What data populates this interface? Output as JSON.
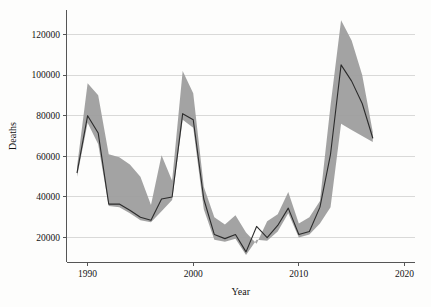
{
  "chart_data": {
    "type": "line",
    "title": "",
    "subtitle": "",
    "xlabel": "Year",
    "ylabel": "Deaths",
    "xlim": [
      1988.0,
      2021.0
    ],
    "ylim": [
      8000,
      132000
    ],
    "grid": true,
    "grid_axis": "y",
    "legend": "none",
    "band_label": "uncertainty interval",
    "band_color": "#9e9e9e",
    "line_color": "#2b2b2b",
    "grid_color": "#c9c9c9",
    "axis_color": "#555555",
    "background_color": "#fdfdfc",
    "x": [
      1989,
      1990,
      1991,
      1992,
      1993,
      1994,
      1995,
      1996,
      1997,
      1998,
      1999,
      2000,
      2001,
      2002,
      2003,
      2004,
      2005,
      2006,
      2007,
      2008,
      2009,
      2010,
      2011,
      2012,
      2013,
      2014,
      2015,
      2016,
      2017
    ],
    "xticks": [
      1990,
      2000,
      2010,
      2020
    ],
    "xticklabels": [
      "1990",
      "2000",
      "2010",
      "2020"
    ],
    "yticks": [
      20000,
      40000,
      60000,
      80000,
      100000,
      120000
    ],
    "yticklabels": [
      "20000",
      "40000",
      "60000",
      "80000",
      "100000",
      "120000"
    ],
    "series": [
      {
        "name": "Deaths (central estimate)",
        "values": [
          52000,
          80000,
          71500,
          36500,
          36500,
          33500,
          30000,
          28500,
          39000,
          40000,
          81000,
          78000,
          39000,
          21500,
          19500,
          21500,
          13000,
          25500,
          20000,
          26000,
          34500,
          21500,
          23000,
          35000,
          61000,
          105000,
          97000,
          86000,
          69000
        ]
      },
      {
        "name": "Upper bound",
        "values": [
          55000,
          96000,
          90000,
          61000,
          59500,
          56000,
          50000,
          36000,
          60500,
          48000,
          102000,
          91000,
          45000,
          30000,
          26500,
          31000,
          22500,
          17000,
          28000,
          31500,
          42500,
          27000,
          30000,
          38000,
          85000,
          127000,
          117000,
          100000,
          72000
        ]
      },
      {
        "name": "Lower bound",
        "values": [
          50000,
          76500,
          66000,
          35500,
          35000,
          32000,
          28500,
          27500,
          33000,
          38500,
          78000,
          74000,
          34000,
          19000,
          18000,
          19500,
          11500,
          19000,
          18500,
          23000,
          32000,
          20000,
          21500,
          27000,
          35000,
          76000,
          73000,
          70000,
          67000
        ]
      }
    ]
  }
}
